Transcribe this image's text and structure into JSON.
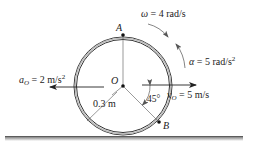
{
  "diagram": {
    "type": "rolling-wheel-kinematics",
    "points": {
      "A": "A",
      "O": "O",
      "B": "B"
    },
    "labels": {
      "omega_sym": "ω",
      "omega_val": " = 4 rad/s",
      "alpha_sym": "α",
      "alpha_val": " = 5 rad/s",
      "alpha_exp": "2",
      "aO_sym": "a",
      "aO_sub": "O",
      "aO_val": " = 2 m/s",
      "aO_exp": "2",
      "vO_sym": "v",
      "vO_sub": "O",
      "vO_val": " = 5 m/s",
      "radius": "0.3 m",
      "angle": "45°"
    },
    "values": {
      "omega_rad_s": 4,
      "alpha_rad_s2": 5,
      "a_O_m_s2": 2,
      "v_O_m_s": 5,
      "radius_m": 0.3,
      "angle_B_deg": 45
    },
    "colors": {
      "line": "#333333",
      "ground": "#777777",
      "arrow_curve": "#666666"
    }
  }
}
